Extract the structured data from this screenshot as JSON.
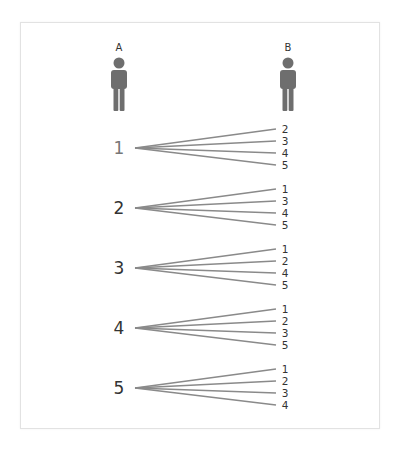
{
  "persons": [
    {
      "label": "A",
      "x": 119
    },
    {
      "label": "B",
      "x": 288
    }
  ],
  "colors": {
    "person": "#6e6e6e",
    "line": "#8a8a8a",
    "text": "#333333",
    "frame": "#e2e2e2"
  },
  "groups": [
    {
      "source": "1",
      "targets": [
        "2",
        "3",
        "4",
        "5"
      ],
      "y": 148
    },
    {
      "source": "2",
      "targets": [
        "1",
        "3",
        "4",
        "5"
      ],
      "y": 208
    },
    {
      "source": "3",
      "targets": [
        "1",
        "2",
        "4",
        "5"
      ],
      "y": 268
    },
    {
      "source": "4",
      "targets": [
        "1",
        "2",
        "3",
        "5"
      ],
      "y": 328
    },
    {
      "source": "5",
      "targets": [
        "1",
        "2",
        "3",
        "4"
      ],
      "y": 388
    }
  ]
}
